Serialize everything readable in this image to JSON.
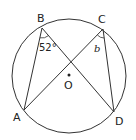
{
  "diagram": {
    "type": "circle-theorem",
    "circle": {
      "cx": 69,
      "cy": 76,
      "r": 57
    },
    "center": {
      "label": "O",
      "x": 69,
      "y": 75
    },
    "points": [
      {
        "label": "A",
        "x": 24,
        "y": 110
      },
      {
        "label": "B",
        "x": 42,
        "y": 28
      },
      {
        "label": "C",
        "x": 103,
        "y": 29
      },
      {
        "label": "D",
        "x": 114,
        "y": 112
      }
    ],
    "segments": [
      [
        "B",
        "A"
      ],
      [
        "B",
        "D"
      ],
      [
        "C",
        "A"
      ],
      [
        "C",
        "D"
      ]
    ],
    "angles": [
      {
        "vertex": "B",
        "label": "52°"
      },
      {
        "vertex": "C",
        "label": "b"
      }
    ],
    "line_color": "#333333"
  },
  "labels": {
    "A": "A",
    "B": "B",
    "C": "C",
    "D": "D",
    "O": "O",
    "angle_B": "52°",
    "angle_C": "b"
  }
}
